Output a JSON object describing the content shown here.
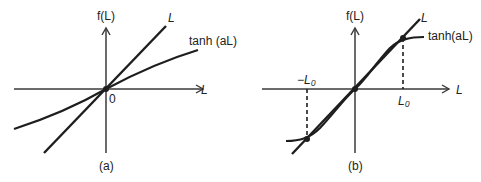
{
  "panels": [
    {
      "id": "a",
      "caption": "(a)",
      "y_axis_label": "f(L)",
      "x_axis_label": "L",
      "origin_label": "0",
      "line_label": "L",
      "curve_label": "tanh (aL)",
      "description": "Line f=L is steeper than tanh(aL) at origin (a < 1): only intersection at 0"
    },
    {
      "id": "b",
      "caption": "(b)",
      "y_axis_label": "f(L)",
      "x_axis_label": "L",
      "line_label": "L",
      "curve_label": "tanh(aL)",
      "pos_intersection_label": "L₀",
      "neg_intersection_label": "−L₀",
      "description": "tanh(aL) steeper than L at origin (a > 1): intersections at 0, L0 and -L0"
    }
  ],
  "colors": {
    "ink": "#1e1e1e",
    "axis": "#3a3a3a",
    "background": "#ffffff"
  }
}
